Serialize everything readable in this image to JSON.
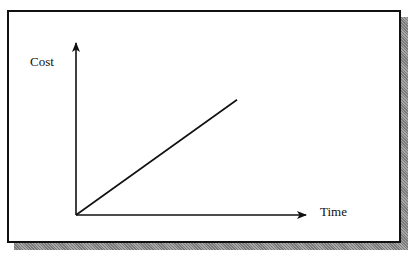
{
  "diagram": {
    "title": "",
    "y_axis_label": "Cost",
    "x_axis_label": "Time",
    "relationship": "linear increasing",
    "line_start": {
      "time": 0,
      "cost": 0
    },
    "line_end_fraction_of_axes": {
      "time": 0.7,
      "cost": 0.67
    }
  },
  "colors": {
    "ink": "#111111",
    "shadow": "#8c8c8c",
    "background": "#ffffff"
  }
}
